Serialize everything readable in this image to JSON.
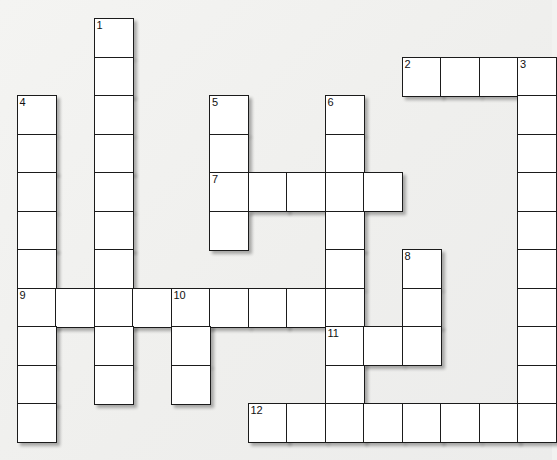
{
  "puzzle": {
    "type": "crossword-grid",
    "cell_size": 38.5,
    "origin_x": 16.5,
    "origin_y": 18.0,
    "background_color": "#f1f1ef",
    "cell_fill": "#ffffff",
    "cell_border": "#1b1b1b",
    "number_color": "#111111",
    "columns": 14,
    "rows": 12,
    "cells": [
      {
        "c": 2,
        "r": 0,
        "n": "1",
        "v": ""
      },
      {
        "c": 2,
        "r": 1,
        "n": "",
        "v": ""
      },
      {
        "c": 10,
        "r": 1,
        "n": "2",
        "v": ""
      },
      {
        "c": 11,
        "r": 1,
        "n": "",
        "v": ""
      },
      {
        "c": 12,
        "r": 1,
        "n": "",
        "v": ""
      },
      {
        "c": 13,
        "r": 1,
        "n": "3",
        "v": ""
      },
      {
        "c": 0,
        "r": 2,
        "n": "4",
        "v": ""
      },
      {
        "c": 2,
        "r": 2,
        "n": "",
        "v": ""
      },
      {
        "c": 5,
        "r": 2,
        "n": "5",
        "v": ""
      },
      {
        "c": 8,
        "r": 2,
        "n": "6",
        "v": ""
      },
      {
        "c": 13,
        "r": 2,
        "n": "",
        "v": ""
      },
      {
        "c": 0,
        "r": 3,
        "n": "",
        "v": ""
      },
      {
        "c": 2,
        "r": 3,
        "n": "",
        "v": ""
      },
      {
        "c": 5,
        "r": 3,
        "n": "",
        "v": ""
      },
      {
        "c": 8,
        "r": 3,
        "n": "",
        "v": ""
      },
      {
        "c": 13,
        "r": 3,
        "n": "",
        "v": ""
      },
      {
        "c": 0,
        "r": 4,
        "n": "",
        "v": ""
      },
      {
        "c": 2,
        "r": 4,
        "n": "",
        "v": ""
      },
      {
        "c": 5,
        "r": 4,
        "n": "7",
        "v": ""
      },
      {
        "c": 6,
        "r": 4,
        "n": "",
        "v": ""
      },
      {
        "c": 7,
        "r": 4,
        "n": "",
        "v": ""
      },
      {
        "c": 8,
        "r": 4,
        "n": "",
        "v": ""
      },
      {
        "c": 9,
        "r": 4,
        "n": "",
        "v": ""
      },
      {
        "c": 13,
        "r": 4,
        "n": "",
        "v": ""
      },
      {
        "c": 0,
        "r": 5,
        "n": "",
        "v": ""
      },
      {
        "c": 2,
        "r": 5,
        "n": "",
        "v": ""
      },
      {
        "c": 5,
        "r": 5,
        "n": "",
        "v": ""
      },
      {
        "c": 8,
        "r": 5,
        "n": "",
        "v": ""
      },
      {
        "c": 13,
        "r": 5,
        "n": "",
        "v": ""
      },
      {
        "c": 0,
        "r": 6,
        "n": "",
        "v": ""
      },
      {
        "c": 2,
        "r": 6,
        "n": "",
        "v": ""
      },
      {
        "c": 8,
        "r": 6,
        "n": "",
        "v": ""
      },
      {
        "c": 10,
        "r": 6,
        "n": "8",
        "v": ""
      },
      {
        "c": 13,
        "r": 6,
        "n": "",
        "v": ""
      },
      {
        "c": 0,
        "r": 7,
        "n": "9",
        "v": ""
      },
      {
        "c": 1,
        "r": 7,
        "n": "",
        "v": ""
      },
      {
        "c": 2,
        "r": 7,
        "n": "",
        "v": ""
      },
      {
        "c": 3,
        "r": 7,
        "n": "",
        "v": ""
      },
      {
        "c": 4,
        "r": 7,
        "n": "10",
        "v": ""
      },
      {
        "c": 5,
        "r": 7,
        "n": "",
        "v": ""
      },
      {
        "c": 6,
        "r": 7,
        "n": "",
        "v": ""
      },
      {
        "c": 7,
        "r": 7,
        "n": "",
        "v": ""
      },
      {
        "c": 8,
        "r": 7,
        "n": "",
        "v": ""
      },
      {
        "c": 10,
        "r": 7,
        "n": "",
        "v": ""
      },
      {
        "c": 13,
        "r": 7,
        "n": "",
        "v": ""
      },
      {
        "c": 0,
        "r": 8,
        "n": "",
        "v": ""
      },
      {
        "c": 2,
        "r": 8,
        "n": "",
        "v": ""
      },
      {
        "c": 4,
        "r": 8,
        "n": "",
        "v": ""
      },
      {
        "c": 8,
        "r": 8,
        "n": "11",
        "v": ""
      },
      {
        "c": 9,
        "r": 8,
        "n": "",
        "v": ""
      },
      {
        "c": 10,
        "r": 8,
        "n": "",
        "v": ""
      },
      {
        "c": 13,
        "r": 8,
        "n": "",
        "v": ""
      },
      {
        "c": 0,
        "r": 9,
        "n": "",
        "v": ""
      },
      {
        "c": 2,
        "r": 9,
        "n": "",
        "v": ""
      },
      {
        "c": 4,
        "r": 9,
        "n": "",
        "v": ""
      },
      {
        "c": 8,
        "r": 9,
        "n": "",
        "v": ""
      },
      {
        "c": 13,
        "r": 9,
        "n": "",
        "v": ""
      },
      {
        "c": 0,
        "r": 10,
        "n": "",
        "v": ""
      },
      {
        "c": 6,
        "r": 10,
        "n": "12",
        "v": ""
      },
      {
        "c": 7,
        "r": 10,
        "n": "",
        "v": ""
      },
      {
        "c": 8,
        "r": 10,
        "n": "",
        "v": ""
      },
      {
        "c": 9,
        "r": 10,
        "n": "",
        "v": ""
      },
      {
        "c": 10,
        "r": 10,
        "n": "",
        "v": ""
      },
      {
        "c": 11,
        "r": 10,
        "n": "",
        "v": ""
      },
      {
        "c": 12,
        "r": 10,
        "n": "",
        "v": ""
      },
      {
        "c": 13,
        "r": 10,
        "n": "",
        "v": ""
      }
    ],
    "numbers_visible": [
      "1",
      "2",
      "3",
      "4",
      "5",
      "6",
      "7",
      "8",
      "9",
      "10",
      "11",
      "12"
    ]
  }
}
